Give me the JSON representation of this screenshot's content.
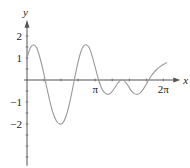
{
  "chart_data": {
    "type": "line",
    "title": "",
    "xlabel": "x",
    "ylabel": "y",
    "xlim": [
      0,
      6.6
    ],
    "ylim": [
      -3.9,
      2.65
    ],
    "grid": false,
    "legend": "none",
    "x_tick_labels": [
      {
        "value": 3.14159,
        "label": "π"
      },
      {
        "value": 6.28319,
        "label": "2π"
      }
    ],
    "x_minor_ticks_step": 0.7854,
    "y_tick_labels": [
      {
        "value": 2,
        "label": "2"
      },
      {
        "value": 1,
        "label": "1"
      },
      {
        "value": -1,
        "label": "−1"
      },
      {
        "value": -2,
        "label": "−2"
      }
    ],
    "y_minor_ticks_step": 0.5,
    "series": [
      {
        "name": "f(x)",
        "x": [
          0,
          0.15,
          0.3,
          0.45,
          0.6,
          0.75,
          0.9,
          1.05,
          1.2,
          1.35,
          1.5,
          1.65,
          1.8,
          1.95,
          2.1,
          2.25,
          2.4,
          2.55,
          2.7,
          2.85,
          3.0,
          3.15,
          3.3,
          3.45,
          3.6,
          3.75,
          3.9,
          4.05,
          4.2,
          4.35,
          4.5,
          4.65,
          4.8,
          4.95,
          5.1,
          5.25,
          5.4,
          5.55,
          5.7,
          5.85,
          6.0,
          6.15,
          6.3,
          6.45
        ],
        "y": [
          1.0,
          1.45,
          1.6,
          1.45,
          1.0,
          0.4,
          -0.3,
          -0.95,
          -1.5,
          -1.85,
          -2.0,
          -1.95,
          -1.65,
          -1.1,
          -0.4,
          0.35,
          1.0,
          1.45,
          1.6,
          1.5,
          1.1,
          0.55,
          0.0,
          -0.4,
          -0.6,
          -0.65,
          -0.55,
          -0.35,
          -0.12,
          0.0,
          -0.05,
          -0.25,
          -0.48,
          -0.62,
          -0.65,
          -0.55,
          -0.35,
          -0.1,
          0.15,
          0.35,
          0.5,
          0.62,
          0.72,
          0.8
        ]
      }
    ]
  }
}
